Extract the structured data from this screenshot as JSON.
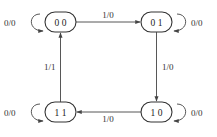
{
  "diagram": {
    "type": "state-machine",
    "colors": {
      "stroke": "#444444",
      "text": "#222222",
      "background": "#ffffff"
    },
    "states": [
      {
        "id": "s00",
        "label": "0 0",
        "self_loop": "0/0"
      },
      {
        "id": "s01",
        "label": "0 1",
        "self_loop": "0/0"
      },
      {
        "id": "s10",
        "label": "1 0",
        "self_loop": "0/0"
      },
      {
        "id": "s11",
        "label": "1 1",
        "self_loop": "0/0"
      }
    ],
    "transitions": [
      {
        "from": "s00",
        "to": "s01",
        "label": "1/0"
      },
      {
        "from": "s01",
        "to": "s10",
        "label": "1/0"
      },
      {
        "from": "s10",
        "to": "s11",
        "label": "1/0"
      },
      {
        "from": "s11",
        "to": "s00",
        "label": "1/1"
      }
    ]
  }
}
